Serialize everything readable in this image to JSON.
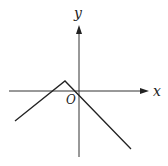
{
  "diagram": {
    "type": "function-graph",
    "axes": {
      "x_label": "x",
      "y_label": "y",
      "origin_label": "O"
    },
    "colors": {
      "line": "#222222",
      "axis": "#333333",
      "background": "#ffffff"
    },
    "curve": {
      "shape": "inverted-V",
      "vertex_position": "above x-axis, left of y-axis",
      "passes_through_origin": true
    }
  }
}
